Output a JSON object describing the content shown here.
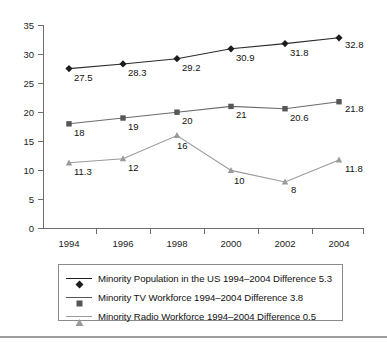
{
  "chart_data": {
    "type": "line",
    "title": "",
    "subtitle": "",
    "xlabel": "",
    "ylabel": "",
    "x": [
      1994,
      1996,
      1998,
      2000,
      2002,
      2004
    ],
    "categories": [
      "1994",
      "1996",
      "1998",
      "2000",
      "2002",
      "2004"
    ],
    "xtick_labels": [
      "1994",
      "1996",
      "1998",
      "2000",
      "2002",
      "2004"
    ],
    "ytick_labels": [
      "0",
      "5",
      "10",
      "15",
      "20",
      "25",
      "30",
      "35"
    ],
    "yticks": [
      0,
      5,
      10,
      15,
      20,
      25,
      30,
      35
    ],
    "ylim": [
      0,
      35
    ],
    "grid": false,
    "legend_position": "bottom",
    "series": [
      {
        "name": "Minority Population in the US 1994–2004 Difference 5.3",
        "marker": "diamond",
        "color": "#1d1d1d",
        "values": [
          27.5,
          28.3,
          29.2,
          30.9,
          31.8,
          32.8
        ],
        "point_labels": [
          "27.5",
          "28.3",
          "29.2",
          "30.9",
          "31.8",
          "32.8"
        ]
      },
      {
        "name": "Minority TV Workforce 1994–2004 Difference 3.8",
        "marker": "square",
        "color": "#565656",
        "values": [
          18,
          19,
          20,
          21,
          20.6,
          21.8
        ],
        "point_labels": [
          "18",
          "19",
          "20",
          "21",
          "20.6",
          "21.8"
        ]
      },
      {
        "name": "Minority Radio Workforce 1994–2004 Difference 0.5",
        "marker": "triangle",
        "color": "#9a9a9a",
        "values": [
          11.3,
          12,
          16,
          10,
          8,
          11.8
        ],
        "point_labels": [
          "11.3",
          "12",
          "16",
          "10",
          "8",
          "11.8"
        ]
      }
    ]
  },
  "legend": {
    "items": [
      {
        "label": "Minority Population in the US 1994–2004 Difference 5.3",
        "marker": "diamond"
      },
      {
        "label": "Minority TV Workforce 1994–2004 Difference 3.8",
        "marker": "square"
      },
      {
        "label": "Minority Radio Workforce 1994–2004 Difference 0.5",
        "marker": "triangle"
      }
    ]
  },
  "axes": {
    "y_labels": [
      "35",
      "30",
      "25",
      "20",
      "15",
      "10",
      "5",
      "0"
    ],
    "x_labels": [
      "1994",
      "1996",
      "1998",
      "2000",
      "2002",
      "2004"
    ]
  },
  "colors": {
    "series_1": "#1d1d1d",
    "series_2": "#565656",
    "series_3": "#9a9a9a",
    "axis": "#6e6e6e",
    "legend_border": "#8a8a8a",
    "rule": "#9d9d9d"
  }
}
